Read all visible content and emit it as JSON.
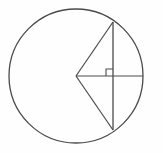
{
  "figure": {
    "background_color": "#fefefe",
    "stroke_color": "#4a4a4a",
    "hatch_color": "#5a5a5a",
    "label_color": "#1d1d1d"
  },
  "circle": {
    "name": "main-circle",
    "center_label": "C",
    "center_x": 76,
    "center_y": 76,
    "radius": 67
  },
  "points": [
    {
      "label": "A",
      "x": 113,
      "y": 22,
      "label_x": 119,
      "label_y": 14,
      "role": "chord-endpoint-top"
    },
    {
      "label": "B",
      "x": 113,
      "y": 130,
      "label_x": 118,
      "label_y": 145,
      "role": "chord-endpoint-bottom"
    },
    {
      "label": "C",
      "x": 76,
      "y": 76,
      "label_x": 62,
      "label_y": 80,
      "role": "circle-center"
    },
    {
      "label": "D",
      "x": 113,
      "y": 76,
      "label_x": 106,
      "label_y": 89,
      "role": "chord-midpoint"
    },
    {
      "label": "E",
      "x": 143,
      "y": 76,
      "label_x": 148,
      "label_y": 81,
      "role": "arc-point"
    }
  ],
  "segments": [
    {
      "name": "radius-CA",
      "from": "C",
      "to": "A"
    },
    {
      "name": "radius-CB",
      "from": "C",
      "to": "B"
    },
    {
      "name": "chord-AB",
      "from": "A",
      "to": "B"
    },
    {
      "name": "axis-CE",
      "from": "C",
      "to": "E"
    }
  ],
  "tick_marks": [
    {
      "name": "tick-CD",
      "segment": "CD",
      "count": 2,
      "x": 95,
      "y": 76
    },
    {
      "name": "tick-DE",
      "segment": "DE",
      "count": 2,
      "x": 128,
      "y": 76
    }
  ],
  "right_angle": {
    "name": "right-angle-at-D",
    "vertex_x": 113,
    "vertex_y": 76,
    "size": 7
  },
  "hatching": {
    "name": "segment-hatching",
    "orientation": "horizontal",
    "line_count": 16,
    "spacing": 6.6,
    "region": "circular segment bounded by chord AB and arc A-E-B"
  },
  "labels": {
    "A": "A",
    "B": "B",
    "C": "C",
    "D": "D",
    "E": "E"
  }
}
